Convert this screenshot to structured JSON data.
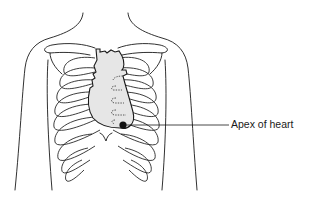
{
  "diagram": {
    "annotations": [
      {
        "label": "Apex of heart",
        "target": "heart-apex"
      }
    ],
    "colors": {
      "line": "#1a1a1a",
      "heart_fill": "#e6e6e6",
      "apex_marker": "#111111",
      "background": "#ffffff"
    }
  }
}
